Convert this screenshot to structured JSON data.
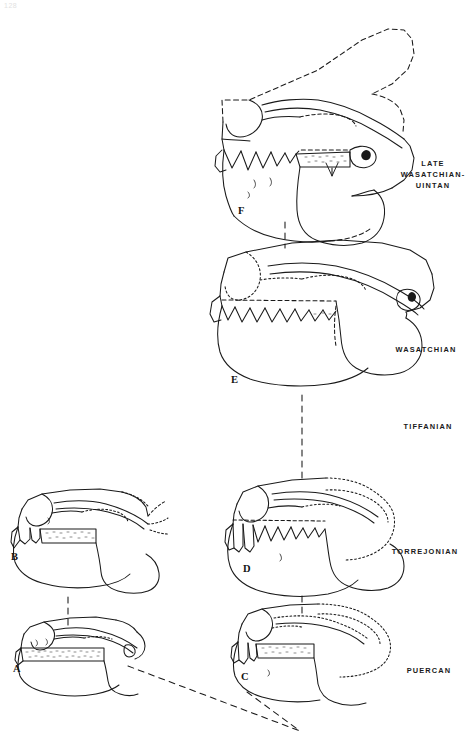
{
  "figure": {
    "page_number": "128",
    "background_color": "#ffffff",
    "ink_color": "#1a1a1a"
  },
  "stage_labels": [
    {
      "id": "late-wasatchian-uintan",
      "text": "LATE\nWASATCHIAN-\nUINTAN",
      "x": 396,
      "y": 158,
      "width": 74
    },
    {
      "id": "wasatchian",
      "text": "WASATCHIAN",
      "x": 382,
      "y": 344,
      "width": 88
    },
    {
      "id": "tiffanian",
      "text": "TIFFANIAN",
      "x": 386,
      "y": 421,
      "width": 84
    },
    {
      "id": "torrejonian",
      "text": "TORREJONIAN",
      "x": 380,
      "y": 546,
      "width": 90
    },
    {
      "id": "puercan",
      "text": "PUERCAN",
      "x": 388,
      "y": 665,
      "width": 82
    }
  ],
  "specimens": [
    {
      "id": "a",
      "label": "A",
      "x": 13,
      "y": 663
    },
    {
      "id": "b",
      "label": "B",
      "x": 11,
      "y": 551
    },
    {
      "id": "c",
      "label": "C",
      "x": 241,
      "y": 671
    },
    {
      "id": "d",
      "label": "D",
      "x": 243,
      "y": 563
    },
    {
      "id": "e",
      "label": "E",
      "x": 231,
      "y": 374
    },
    {
      "id": "f",
      "label": "F",
      "x": 238,
      "y": 205
    }
  ],
  "connectors": [
    {
      "id": "f-to-e",
      "from": "F",
      "to": "E"
    },
    {
      "id": "e-to-d",
      "from": "E",
      "to": "D"
    },
    {
      "id": "d-to-c",
      "from": "D",
      "to": "C"
    },
    {
      "id": "b-to-a",
      "from": "B",
      "to": "A"
    },
    {
      "id": "a-to-root",
      "from": "A",
      "to": "root"
    },
    {
      "id": "c-to-root",
      "from": "C",
      "to": "root"
    }
  ]
}
